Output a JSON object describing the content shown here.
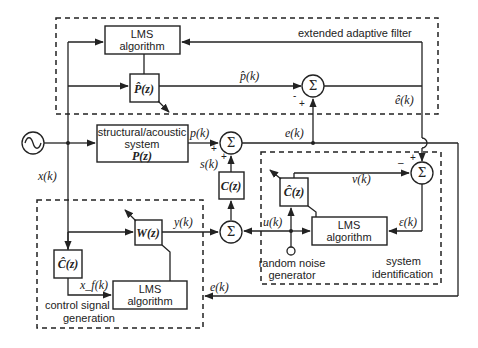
{
  "diagram": {
    "groups": {
      "extended_adaptive_filter": "extended adaptive filter",
      "control_signal_generation_line1": "control signal",
      "control_signal_generation_line2": "generation",
      "system_identification_line1": "system",
      "system_identification_line2": "identification"
    },
    "blocks": {
      "lms_top_line1": "LMS",
      "lms_top_line2": "algorithm",
      "p_hat": "P̂(z)",
      "plant_line1": "structural/acoustic",
      "plant_line2": "system",
      "plant_line3": "P(z)",
      "c": "C(z)",
      "c_hat_id": "Ĉ(z)",
      "lms_id_line1": "LMS",
      "lms_id_line2": "algorithm",
      "w": "W(z)",
      "c_hat_ctrl": "Ĉ(z)",
      "lms_ctrl_line1": "LMS",
      "lms_ctrl_line2": "algorithm",
      "noise_line1": "random noise",
      "noise_line2": "generator"
    },
    "signals": {
      "x": "x(k)",
      "p_hat_k": "p̂(k)",
      "e_hat_k": "ê(k)",
      "p_k": "p(k)",
      "e_k_top": "e(k)",
      "s_k": "s(k)",
      "v_k": "v(k)",
      "u_k": "u(k)",
      "eps_k": "ε(k)",
      "y_k": "y(k)",
      "xf_k": "x_f(k)",
      "e_k_ctrl": "e(k)"
    },
    "sum_symbol": "Σ",
    "signs": {
      "plus": "+",
      "minus": "-",
      "minus_long": "–"
    },
    "source_icon": "sine-wave-source"
  }
}
